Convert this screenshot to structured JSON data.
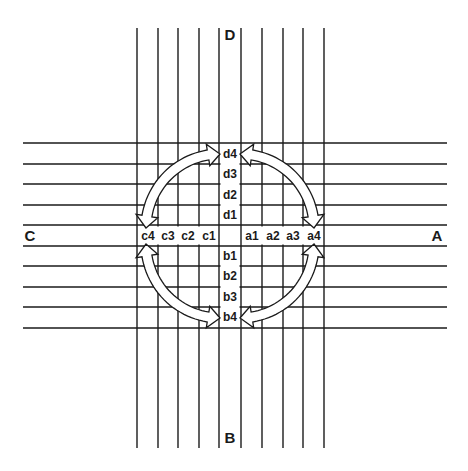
{
  "diagram": {
    "directions": {
      "top": "D",
      "bottom": "B",
      "left": "C",
      "right": "A"
    },
    "column_labels_top": [
      "d4",
      "d3",
      "d2",
      "d1"
    ],
    "column_labels_bottom": [
      "b1",
      "b2",
      "b3",
      "b4"
    ],
    "row_labels_left": [
      "c4",
      "c3",
      "c2",
      "c1"
    ],
    "row_labels_right": [
      "a1",
      "a2",
      "a3",
      "a4"
    ],
    "arrows": [
      {
        "name": "arrow-d4-c4",
        "from": "d4",
        "to": "c4",
        "type": "double-headed curved"
      },
      {
        "name": "arrow-d4-a4",
        "from": "d4",
        "to": "a4",
        "type": "double-headed curved"
      },
      {
        "name": "arrow-c4-b4",
        "from": "c4",
        "to": "b4",
        "type": "double-headed curved"
      },
      {
        "name": "arrow-a4-b4",
        "from": "a4",
        "to": "b4",
        "type": "double-headed curved"
      }
    ],
    "line_color": "#1a1a1a",
    "background_color": "#ffffff"
  }
}
